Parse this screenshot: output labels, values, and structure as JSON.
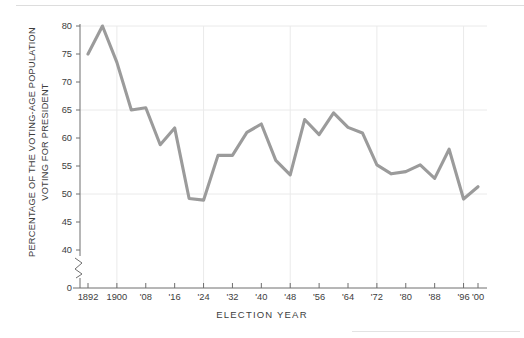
{
  "chart_data": {
    "type": "line",
    "title": "",
    "xlabel": "ELECTION  YEAR",
    "ylabel": "PERCENTAGE OF THE VOTING-AGE POPULATION\nVOTING FOR PRESIDENT",
    "ylim": [
      38,
      81
    ],
    "y_axis_break": true,
    "y_break_symbol": "zigzag",
    "yticks": [
      80,
      75,
      70,
      65,
      60,
      55,
      50,
      45,
      40,
      0
    ],
    "ytick_labels": [
      "80",
      "75",
      "70",
      "65",
      "60",
      "55",
      "50",
      "45",
      "40",
      "0"
    ],
    "gridlines": {
      "horizontal_at": [
        80,
        65,
        50
      ],
      "vertical_at": [
        1900,
        1924,
        1948,
        1972,
        1996
      ],
      "visible": true
    },
    "xticks": [
      1892,
      1900,
      1908,
      1916,
      1924,
      1932,
      1940,
      1948,
      1956,
      1964,
      1972,
      1980,
      1988,
      1996,
      2000
    ],
    "xtick_labels": [
      "1892",
      "1900",
      "'08",
      "'16",
      "'24",
      "'32",
      "'40",
      "'48",
      "'56",
      "'64",
      "'72",
      "'80",
      "'88",
      "'96",
      "'00"
    ],
    "xlim": [
      1890,
      2002
    ],
    "line_color": "#9b9b9b",
    "line_width": 3.1,
    "grid_color": "#eaeaea",
    "axis_color": "#6e6e6e",
    "x": [
      1892,
      1896,
      1900,
      1904,
      1908,
      1912,
      1916,
      1920,
      1924,
      1928,
      1932,
      1936,
      1940,
      1944,
      1948,
      1952,
      1956,
      1960,
      1964,
      1968,
      1972,
      1976,
      1980,
      1984,
      1988,
      1992,
      1996,
      2000
    ],
    "values": [
      75.0,
      80.0,
      73.5,
      65.0,
      65.4,
      58.8,
      61.8,
      49.2,
      48.9,
      56.9,
      56.9,
      61.0,
      62.5,
      56.0,
      53.4,
      63.3,
      60.6,
      64.5,
      61.9,
      60.9,
      55.2,
      53.6,
      54.0,
      55.2,
      52.8,
      58.0,
      49.1,
      51.3
    ]
  }
}
